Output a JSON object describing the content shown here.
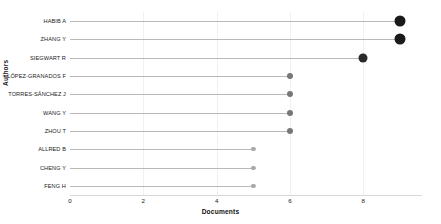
{
  "chart_data": {
    "type": "bar",
    "subtype": "lollipop-horizontal",
    "title": "",
    "xlabel": "Documents",
    "ylabel": "Authors",
    "categories": [
      "HABIB A",
      "ZHANG Y",
      "SIEGWART R",
      "LÓPEZ-GRANADOS F",
      "TORRES-SÁNCHEZ J",
      "WANG Y",
      "ZHOU T",
      "ALLRED B",
      "CHENG Y",
      "FENG H"
    ],
    "values": [
      9,
      9,
      8,
      6,
      6,
      6,
      6,
      5,
      5,
      5
    ],
    "xlim": [
      0,
      9.6
    ],
    "xticks": [
      0,
      2,
      4,
      6,
      8
    ],
    "xticklabels": [
      "0",
      "2",
      "4",
      "6",
      "8"
    ],
    "grid": "vertical-light",
    "legend": "none",
    "marker_sizes": [
      11,
      11,
      9,
      6,
      6,
      6,
      6,
      4.2,
      4.2,
      4.2
    ],
    "marker_colors": [
      "#1a1a1a",
      "#1a1a1a",
      "#2a2a2a",
      "#777777",
      "#777777",
      "#777777",
      "#777777",
      "#a8a8a8",
      "#a8a8a8",
      "#a8a8a8"
    ],
    "stem_color": "#b9b9b9",
    "axis_color": "#d8d8d8",
    "grid_color": "#f0f0f0",
    "background": "#ffffff"
  }
}
